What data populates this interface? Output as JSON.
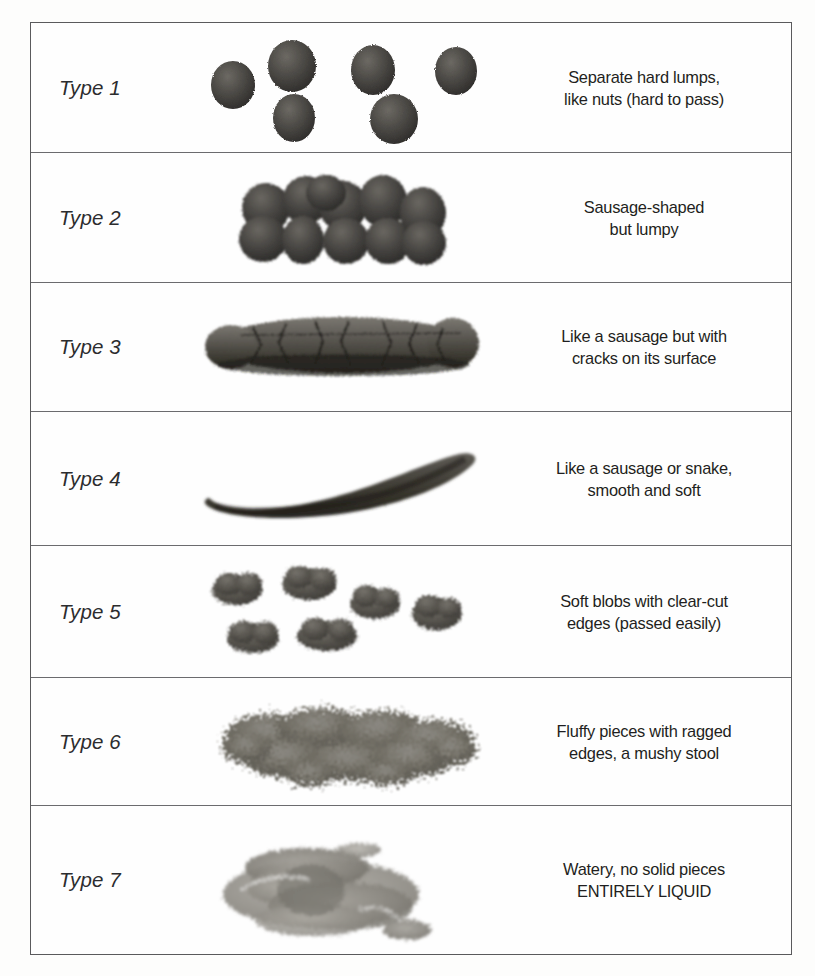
{
  "chart": {
    "rows": [
      {
        "type_label": "Type 1",
        "description": "Separate hard lumps,\nlike nuts (hard to pass)",
        "art_name": "separate-hard-lumps-illustration"
      },
      {
        "type_label": "Type 2",
        "description": "Sausage-shaped\nbut lumpy",
        "art_name": "sausage-shaped-lumpy-illustration"
      },
      {
        "type_label": "Type 3",
        "description": "Like a sausage but with\ncracks on its surface",
        "art_name": "cracked-sausage-illustration"
      },
      {
        "type_label": "Type 4",
        "description": "Like a sausage or snake,\nsmooth and soft",
        "art_name": "smooth-snake-illustration"
      },
      {
        "type_label": "Type 5",
        "description": "Soft blobs with clear-cut\nedges (passed easily)",
        "art_name": "soft-blobs-illustration"
      },
      {
        "type_label": "Type 6",
        "description": "Fluffy pieces with ragged\nedges, a mushy stool",
        "art_name": "fluffy-mushy-illustration"
      },
      {
        "type_label": "Type 7",
        "description": "Watery, no solid pieces\nENTIRELY LIQUID",
        "art_name": "watery-liquid-illustration"
      }
    ],
    "colors": {
      "page_background": "#fdfdfc",
      "table_border": "#5a5a5c",
      "row_divider": "#6b6b6e",
      "label_text": "#2c2c2e",
      "description_text": "#1f1f21",
      "stool_dark": "#3b3936",
      "stool_mid": "#5d5a55",
      "stool_light": "#8d8a84",
      "stool_liquid": "#9b9892"
    }
  }
}
